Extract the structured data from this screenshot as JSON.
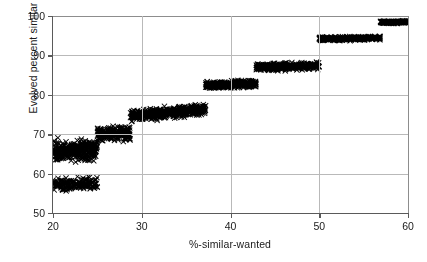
{
  "chart_data": {
    "type": "scatter",
    "title": "",
    "xlabel": "%-similar-wanted",
    "ylabel": "Evolved percent similar",
    "xlim": [
      20,
      60
    ],
    "ylim": [
      50,
      100
    ],
    "xticks": [
      20,
      30,
      40,
      50,
      60
    ],
    "yticks": [
      50,
      60,
      70,
      80,
      90,
      100
    ],
    "xtick_labels": [
      "20",
      "30",
      "40",
      "50",
      "60"
    ],
    "ytick_labels": [
      "50",
      "60",
      "70",
      "80",
      "90",
      "100"
    ],
    "grid": true,
    "legend": "none",
    "marker": "x",
    "marker_color": "#000000",
    "marker_size": 2.6,
    "point_count": 2400,
    "bands": [
      {
        "name": "band-1-upper",
        "x_start": 20.0,
        "x_end": 25.0,
        "y_start": 65.5,
        "y_end": 66.0,
        "spread": 4.6,
        "density": 330
      },
      {
        "name": "band-1-lower",
        "x_start": 20.0,
        "x_end": 25.0,
        "y_start": 57.2,
        "y_end": 57.6,
        "spread": 2.6,
        "density": 190
      },
      {
        "name": "band-2",
        "x_start": 25.0,
        "x_end": 28.7,
        "y_start": 70.0,
        "y_end": 70.3,
        "spread": 3.1,
        "density": 230
      },
      {
        "name": "band-3",
        "x_start": 28.7,
        "x_end": 37.2,
        "y_start": 74.6,
        "y_end": 76.4,
        "spread": 2.3,
        "density": 520
      },
      {
        "name": "band-4",
        "x_start": 37.2,
        "x_end": 42.9,
        "y_start": 82.4,
        "y_end": 82.9,
        "spread": 1.7,
        "density": 330
      },
      {
        "name": "band-5",
        "x_start": 42.9,
        "x_end": 50.0,
        "y_start": 87.0,
        "y_end": 87.4,
        "spread": 1.6,
        "density": 380
      },
      {
        "name": "band-6",
        "x_start": 50.0,
        "x_end": 56.9,
        "y_start": 94.2,
        "y_end": 94.4,
        "spread": 0.85,
        "density": 330
      },
      {
        "name": "band-7",
        "x_start": 56.9,
        "x_end": 60.0,
        "y_start": 98.4,
        "y_end": 98.5,
        "spread": 0.55,
        "density": 200
      }
    ]
  }
}
